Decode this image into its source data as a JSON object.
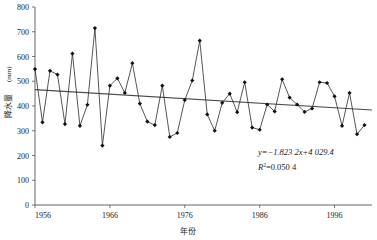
{
  "chart_data": {
    "type": "line",
    "title": "",
    "xlabel": "年份",
    "ylabel": "降水量(mm)",
    "ylabel_text": "降水量",
    "ylabel_unit": "(mm)",
    "xlim": [
      1956,
      2001
    ],
    "ylim": [
      0,
      800
    ],
    "ytick_step": 100,
    "grid": false,
    "legend": "none",
    "x_tick_labels": [
      "1956",
      "1966",
      "1976",
      "1986",
      "1996"
    ],
    "x_tick_values": [
      1956,
      1966,
      1976,
      1986,
      1996
    ],
    "y_tick_labels": [
      "0",
      "100",
      "200",
      "300",
      "400",
      "500",
      "600",
      "700",
      "800"
    ],
    "y_tick_values": [
      0,
      100,
      200,
      300,
      400,
      500,
      600,
      700,
      800
    ],
    "marker": "diamond",
    "series": [
      {
        "name": "降水量",
        "x": [
          1956,
          1957,
          1958,
          1959,
          1960,
          1961,
          1962,
          1963,
          1964,
          1965,
          1966,
          1967,
          1968,
          1969,
          1970,
          1971,
          1972,
          1973,
          1974,
          1975,
          1976,
          1977,
          1978,
          1979,
          1980,
          1981,
          1982,
          1983,
          1984,
          1985,
          1986,
          1987,
          1988,
          1989,
          1990,
          1991,
          1992,
          1993,
          1994,
          1995,
          1996,
          1997,
          1998,
          1999,
          2000,
          2001
        ],
        "values": [
          549,
          334,
          542,
          527,
          327,
          612,
          320,
          405,
          715,
          240,
          482,
          512,
          453,
          573,
          410,
          337,
          323,
          482,
          275,
          291,
          424,
          503,
          664,
          366,
          300,
          413,
          450,
          375,
          496,
          313,
          304,
          406,
          378,
          508,
          434,
          406,
          376,
          390,
          496,
          493,
          439,
          320,
          453,
          286,
          323,
          null
        ]
      }
    ],
    "trend": {
      "equation": "y=−1.823 2x+4 029.4",
      "r_squared_label": "R",
      "r_squared_sup": "2",
      "r_squared_value": "=0.050 4",
      "slope": -1.8232,
      "intercept": 4029.4,
      "r2": 0.0504,
      "y_start": 466,
      "y_end": 384
    },
    "colors": {
      "series": "#2b2b2b",
      "trend": "#4a4a4a",
      "axis": "#555555",
      "marker": "#111111",
      "background": "#ffffff"
    }
  }
}
